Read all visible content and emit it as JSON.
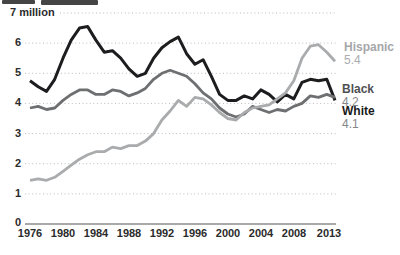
{
  "chart_data": {
    "type": "line",
    "title": "",
    "ylabel_unit": "million",
    "ylim": [
      0,
      7
    ],
    "grid": "dotted-horizontal",
    "legend_position": "right-of-lines",
    "years": [
      1976,
      1977,
      1978,
      1979,
      1980,
      1981,
      1982,
      1983,
      1984,
      1985,
      1986,
      1987,
      1988,
      1989,
      1990,
      1991,
      1992,
      1993,
      1994,
      1995,
      1996,
      1997,
      1998,
      1999,
      2000,
      2001,
      2002,
      2003,
      2004,
      2005,
      2006,
      2007,
      2008,
      2009,
      2010,
      2011,
      2012,
      2013
    ],
    "series": [
      {
        "name": "White",
        "color": "#1d1d1f",
        "end_value": 4.1,
        "values": [
          4.75,
          4.55,
          4.4,
          4.8,
          5.5,
          6.1,
          6.5,
          6.55,
          6.1,
          5.7,
          5.75,
          5.5,
          5.15,
          4.9,
          5.0,
          5.5,
          5.85,
          6.05,
          6.2,
          5.65,
          5.3,
          5.45,
          4.9,
          4.3,
          4.1,
          4.1,
          4.25,
          4.15,
          4.45,
          4.3,
          4.05,
          4.3,
          4.15,
          4.7,
          4.8,
          4.75,
          4.8,
          4.1
        ]
      },
      {
        "name": "Black",
        "color": "#6e6f71",
        "end_value": 4.2,
        "values": [
          3.85,
          3.9,
          3.8,
          3.85,
          4.1,
          4.3,
          4.45,
          4.45,
          4.3,
          4.3,
          4.45,
          4.4,
          4.25,
          4.35,
          4.5,
          4.8,
          5.0,
          5.1,
          5.0,
          4.9,
          4.65,
          4.35,
          4.15,
          3.85,
          3.65,
          3.55,
          3.65,
          3.9,
          3.8,
          3.7,
          3.8,
          3.75,
          3.9,
          4.0,
          4.25,
          4.2,
          4.3,
          4.2
        ]
      },
      {
        "name": "Hispanic",
        "color": "#a9abac",
        "end_value": 5.4,
        "values": [
          1.45,
          1.5,
          1.45,
          1.55,
          1.75,
          1.95,
          2.15,
          2.3,
          2.4,
          2.4,
          2.55,
          2.5,
          2.6,
          2.6,
          2.75,
          3.0,
          3.45,
          3.75,
          4.1,
          3.9,
          4.2,
          4.15,
          3.95,
          3.7,
          3.5,
          3.45,
          3.7,
          3.85,
          3.9,
          3.95,
          4.15,
          4.35,
          4.75,
          5.5,
          5.9,
          5.95,
          5.7,
          5.4
        ]
      }
    ],
    "y_ticks": [
      {
        "value": 7,
        "label": "7 million"
      },
      {
        "value": 6,
        "label": "6"
      },
      {
        "value": 5,
        "label": "5"
      },
      {
        "value": 4,
        "label": "4"
      },
      {
        "value": 3,
        "label": "3"
      },
      {
        "value": 2,
        "label": "2"
      },
      {
        "value": 1,
        "label": "1"
      },
      {
        "value": 0,
        "label": "0"
      }
    ],
    "x_ticks": [
      "1976",
      "1980",
      "1984",
      "1988",
      "1992",
      "1996",
      "2000",
      "2004",
      "2008",
      "2013"
    ]
  },
  "legend": {
    "items": [
      {
        "label": "Hispanic",
        "value": "5.4",
        "label_color": "#a5a7a9",
        "value_color": "#aaacae"
      },
      {
        "label": "Black",
        "value": "4.2",
        "label_color": "#4f5052",
        "value_color": "#85878a"
      },
      {
        "label": "White",
        "value": "4.1",
        "label_color": "#1a1a1a",
        "value_color": "#85878a"
      }
    ]
  }
}
